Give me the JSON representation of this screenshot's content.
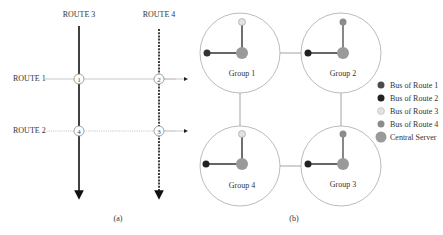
{
  "panel_a": {
    "caption": "(a)",
    "routes": {
      "route1": "ROUTE 1",
      "route2": "ROUTE 2",
      "route3": "ROUTE 3",
      "route4": "ROUTE 4"
    },
    "intersections": [
      "1",
      "2",
      "3",
      "4"
    ]
  },
  "panel_b": {
    "caption": "(b)",
    "groups": [
      "Group 1",
      "Group 2",
      "Group 3",
      "Group 4"
    ],
    "legend": [
      {
        "label": "Bus of Route 1",
        "color": "#4a4a4a"
      },
      {
        "label": "Bus of Route 2",
        "color": "#222222"
      },
      {
        "label": "Bus of Route 3",
        "color": "#e2e2e2"
      },
      {
        "label": "Bus of Route 4",
        "color": "#8c8c8c"
      },
      {
        "label": "Central Server",
        "color": "#9a9a9a"
      }
    ]
  },
  "colors": {
    "route1_bus": "#4a4a4a",
    "route2_bus": "#222222",
    "route3_bus": "#e2e2e2",
    "route4_bus": "#8c8c8c",
    "server": "#9a9a9a",
    "group_circle": "#aaaaaa",
    "connector": "#999999"
  }
}
